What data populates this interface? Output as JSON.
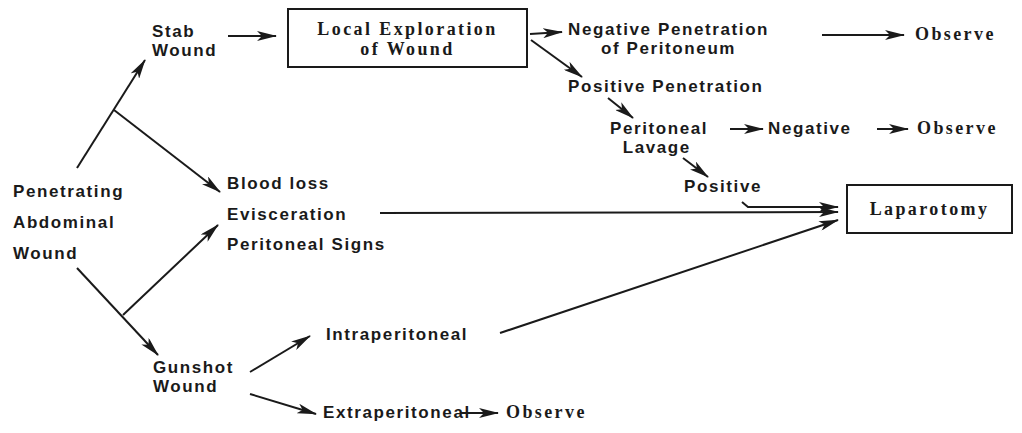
{
  "diagram": {
    "type": "flowchart",
    "colors": {
      "ink": "#1a1a1a",
      "background": "#ffffff"
    },
    "nodes": {
      "start": "Penetrating\nAbdominal\nWound",
      "stab_wound": "Stab\nWound",
      "local_exploration": "Local Exploration\nof Wound",
      "negative_penetration": "Negative Penetration\nof Peritoneum",
      "observe_1": "Observe",
      "positive_penetration": "Positive Penetration",
      "peritoneal_lavage": "Peritoneal\n  Lavage",
      "lavage_negative": "Negative",
      "observe_2": "Observe",
      "lavage_positive": "Positive",
      "signs": [
        "Blood loss",
        "Evisceration",
        "Peritoneal Signs"
      ],
      "laparotomy": "Laparotomy",
      "gunshot_wound": "Gunshot\nWound",
      "intraperitoneal": "Intraperitoneal",
      "extraperitoneal": "Extraperitoneal",
      "observe_3": "Observe"
    },
    "edges": [
      {
        "from": "Penetrating Abdominal Wound",
        "to": "Stab Wound"
      },
      {
        "from": "Penetrating Abdominal Wound",
        "to": "Blood loss / Evisceration / Peritoneal Signs"
      },
      {
        "from": "Penetrating Abdominal Wound",
        "to": "Gunshot Wound"
      },
      {
        "from": "Stab Wound",
        "to": "Local Exploration of Wound"
      },
      {
        "from": "Local Exploration of Wound",
        "to": "Negative Penetration of Peritoneum"
      },
      {
        "from": "Local Exploration of Wound",
        "to": "Positive Penetration"
      },
      {
        "from": "Negative Penetration of Peritoneum",
        "to": "Observe"
      },
      {
        "from": "Positive Penetration",
        "to": "Peritoneal Lavage"
      },
      {
        "from": "Peritoneal Lavage",
        "to": "Negative"
      },
      {
        "from": "Negative",
        "to": "Observe"
      },
      {
        "from": "Peritoneal Lavage",
        "to": "Positive"
      },
      {
        "from": "Positive",
        "to": "Laparotomy"
      },
      {
        "from": "Blood loss / Evisceration / Peritoneal Signs",
        "to": "Laparotomy"
      },
      {
        "from": "Gunshot Wound",
        "to": "Intraperitoneal"
      },
      {
        "from": "Gunshot Wound",
        "to": "Extraperitoneal"
      },
      {
        "from": "Intraperitoneal",
        "to": "Laparotomy"
      },
      {
        "from": "Extraperitoneal",
        "to": "Observe"
      }
    ]
  }
}
